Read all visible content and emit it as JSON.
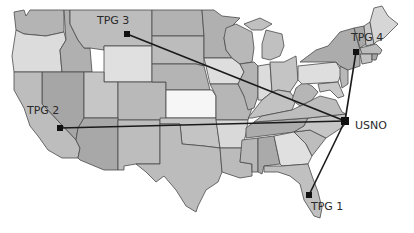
{
  "map": {
    "title": "",
    "hub": {
      "id": "usno",
      "label": "USNO",
      "x": 345,
      "y": 121,
      "label_x": 355,
      "label_y": 129
    },
    "sites": [
      {
        "id": "tpg1",
        "label": "TPG 1",
        "x": 309,
        "y": 195,
        "label_x": 311,
        "label_y": 210
      },
      {
        "id": "tpg2",
        "label": "TPG 2",
        "x": 60,
        "y": 128,
        "label_x": 27,
        "label_y": 114
      },
      {
        "id": "tpg3",
        "label": "TPG 3",
        "x": 127,
        "y": 34,
        "label_x": 97,
        "label_y": 24
      },
      {
        "id": "tpg4",
        "label": "TPG 4",
        "x": 356,
        "y": 52,
        "label_x": 351,
        "label_y": 41
      }
    ],
    "colors": {
      "background": "#ffffff",
      "line": "#1a1a1a",
      "marker": "#111111",
      "border": "#4a4a4a",
      "shade_dark": "#a9a9a9",
      "shade_mid": "#b8b8b8",
      "shade_light": "#c9c9c9",
      "shade_pale": "#dedede",
      "shade_white": "#f4f4f4"
    }
  }
}
